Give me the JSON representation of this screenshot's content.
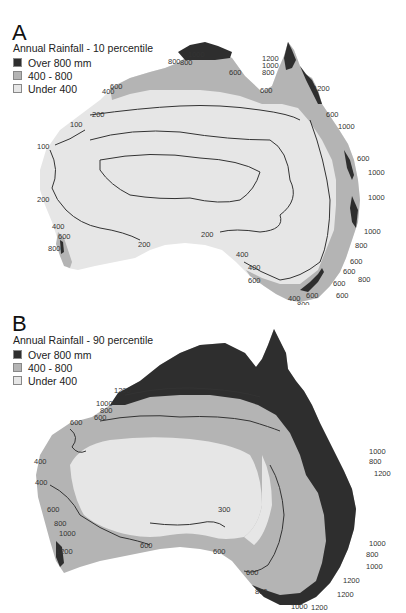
{
  "colors": {
    "over_800": "#2e2e2e",
    "range_400_800": "#b4b4b4",
    "under_400": "#e6e6e6",
    "contour_line": "#333333",
    "background": "#ffffff"
  },
  "panels": [
    {
      "letter": "A",
      "legend": {
        "title": "Annual Rainfall - 10 percentile",
        "items": [
          {
            "label": "Over 800 mm",
            "color": "#2e2e2e"
          },
          {
            "label": "400 - 800",
            "color": "#b4b4b4"
          },
          {
            "label": "Under 400",
            "color": "#e6e6e6"
          }
        ]
      },
      "contour_labels": [
        {
          "text": "1000",
          "x": 188,
          "y": 57
        },
        {
          "text": "800",
          "x": 168,
          "y": 64
        },
        {
          "text": "800",
          "x": 180,
          "y": 65
        },
        {
          "text": "600",
          "x": 229,
          "y": 75
        },
        {
          "text": "1200",
          "x": 262,
          "y": 61
        },
        {
          "text": "1000",
          "x": 262,
          "y": 68
        },
        {
          "text": "800",
          "x": 262,
          "y": 75
        },
        {
          "text": "1200",
          "x": 313,
          "y": 91
        },
        {
          "text": "600",
          "x": 260,
          "y": 93
        },
        {
          "text": "600",
          "x": 326,
          "y": 117
        },
        {
          "text": "1000",
          "x": 338,
          "y": 129
        },
        {
          "text": "600",
          "x": 357,
          "y": 161
        },
        {
          "text": "1000",
          "x": 368,
          "y": 175
        },
        {
          "text": "1000",
          "x": 368,
          "y": 200
        },
        {
          "text": "1000",
          "x": 364,
          "y": 234
        },
        {
          "text": "800",
          "x": 355,
          "y": 248
        },
        {
          "text": "600",
          "x": 350,
          "y": 264
        },
        {
          "text": "600",
          "x": 343,
          "y": 274
        },
        {
          "text": "800",
          "x": 358,
          "y": 282
        },
        {
          "text": "600",
          "x": 333,
          "y": 286
        },
        {
          "text": "600",
          "x": 336,
          "y": 298
        },
        {
          "text": "400",
          "x": 102,
          "y": 94
        },
        {
          "text": "600",
          "x": 110,
          "y": 89
        },
        {
          "text": "200",
          "x": 92,
          "y": 117
        },
        {
          "text": "100",
          "x": 70,
          "y": 127
        },
        {
          "text": "100",
          "x": 37,
          "y": 149
        },
        {
          "text": "200",
          "x": 37,
          "y": 202
        },
        {
          "text": "400",
          "x": 52,
          "y": 229
        },
        {
          "text": "600",
          "x": 58,
          "y": 239
        },
        {
          "text": "800",
          "x": 48,
          "y": 251
        },
        {
          "text": "200",
          "x": 138,
          "y": 247
        },
        {
          "text": "200",
          "x": 201,
          "y": 237
        },
        {
          "text": "400",
          "x": 236,
          "y": 257
        },
        {
          "text": "400",
          "x": 248,
          "y": 270
        },
        {
          "text": "600",
          "x": 248,
          "y": 283
        },
        {
          "text": "400",
          "x": 288,
          "y": 301
        },
        {
          "text": "600",
          "x": 306,
          "y": 298
        },
        {
          "text": "800",
          "x": 297,
          "y": 307
        }
      ]
    },
    {
      "letter": "B",
      "legend": {
        "title": "Annual Rainfall - 90 percentile",
        "items": [
          {
            "label": "Over 800 mm",
            "color": "#2e2e2e"
          },
          {
            "label": "400 - 800",
            "color": "#b4b4b4"
          },
          {
            "label": "Under 400",
            "color": "#e6e6e6"
          }
        ]
      },
      "contour_labels": [
        {
          "text": "1200",
          "x": 114,
          "y": 88
        },
        {
          "text": "1000",
          "x": 96,
          "y": 101
        },
        {
          "text": "800",
          "x": 100,
          "y": 108
        },
        {
          "text": "600",
          "x": 94,
          "y": 115
        },
        {
          "text": "600",
          "x": 70,
          "y": 120
        },
        {
          "text": "400",
          "x": 34,
          "y": 159
        },
        {
          "text": "400",
          "x": 35,
          "y": 180
        },
        {
          "text": "600",
          "x": 47,
          "y": 207
        },
        {
          "text": "800",
          "x": 54,
          "y": 221
        },
        {
          "text": "1000",
          "x": 59,
          "y": 231
        },
        {
          "text": "1200",
          "x": 56,
          "y": 249
        },
        {
          "text": "600",
          "x": 140,
          "y": 243
        },
        {
          "text": "300",
          "x": 218,
          "y": 207
        },
        {
          "text": "600",
          "x": 213,
          "y": 249
        },
        {
          "text": "600",
          "x": 246,
          "y": 270
        },
        {
          "text": "800",
          "x": 255,
          "y": 289
        },
        {
          "text": "1000",
          "x": 291,
          "y": 304
        },
        {
          "text": "1200",
          "x": 311,
          "y": 305
        },
        {
          "text": "1200",
          "x": 337,
          "y": 292
        },
        {
          "text": "1200",
          "x": 343,
          "y": 278
        },
        {
          "text": "1000",
          "x": 366,
          "y": 264
        },
        {
          "text": "800",
          "x": 366,
          "y": 252
        },
        {
          "text": "1000",
          "x": 369,
          "y": 241
        },
        {
          "text": "1000",
          "x": 369,
          "y": 149
        },
        {
          "text": "800",
          "x": 369,
          "y": 159
        },
        {
          "text": "1200",
          "x": 374,
          "y": 171
        }
      ]
    }
  ]
}
